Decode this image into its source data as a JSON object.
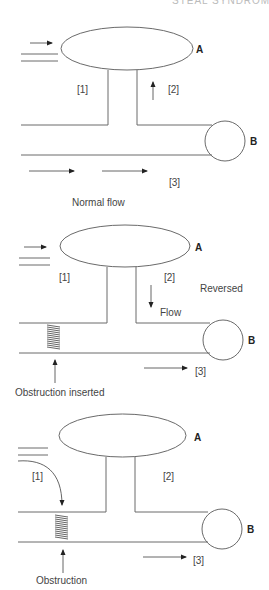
{
  "header": {
    "title": "STEAL SYNDROME"
  },
  "panels": [
    {
      "id": "normal",
      "caption": "Normal flow",
      "vessel_a_label": "A",
      "vessel_b_label": "B",
      "segment_labels": [
        "[1]",
        "[2]",
        "[3]"
      ],
      "extra_labels": []
    },
    {
      "id": "reversed",
      "caption": "Obstruction inserted",
      "vessel_a_label": "A",
      "vessel_b_label": "B",
      "segment_labels": [
        "[1]",
        "[2]",
        "[3]"
      ],
      "extra_labels": [
        "Reversed",
        "Flow"
      ]
    },
    {
      "id": "obstruction",
      "caption": "Obstruction",
      "vessel_a_label": "A",
      "vessel_b_label": "B",
      "segment_labels": [
        "[1]",
        "[2]",
        "[3]"
      ],
      "extra_labels": []
    }
  ]
}
